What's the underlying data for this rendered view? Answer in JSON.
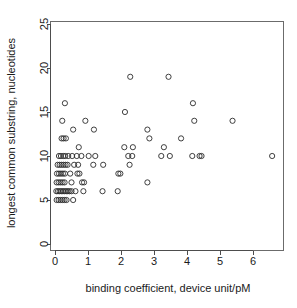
{
  "chart_data": {
    "type": "scatter",
    "title": "",
    "xlabel": "binding coefficient, device unit/pM",
    "ylabel": "longest common substring, nucleotides",
    "xlim": [
      -0.28,
      6.95
    ],
    "ylim": [
      -1.1,
      26.2
    ],
    "xticks": [
      0,
      1,
      2,
      3,
      4,
      5,
      6
    ],
    "xticklabels": [
      "0",
      "1",
      "2",
      "3",
      "4",
      "5",
      "6"
    ],
    "yticks": [
      0,
      5,
      10,
      15,
      20,
      25
    ],
    "yticklabels": [
      "0",
      "5",
      "10",
      "15",
      "20",
      "25"
    ],
    "grid": false,
    "legend": false,
    "marker": "open-circle",
    "marker_color": "#2b2b2b",
    "marker_radius_px": 2.6,
    "points": [
      [
        0.3,
        16
      ],
      [
        0.22,
        14
      ],
      [
        0.55,
        13
      ],
      [
        0.92,
        14
      ],
      [
        1.18,
        13
      ],
      [
        0.2,
        12
      ],
      [
        0.26,
        12
      ],
      [
        0.33,
        12
      ],
      [
        0.72,
        11
      ],
      [
        0.12,
        10
      ],
      [
        0.18,
        10
      ],
      [
        0.25,
        10
      ],
      [
        0.31,
        10
      ],
      [
        0.4,
        10
      ],
      [
        0.52,
        10
      ],
      [
        0.66,
        10
      ],
      [
        0.8,
        10
      ],
      [
        1.02,
        10
      ],
      [
        0.08,
        9
      ],
      [
        0.14,
        9
      ],
      [
        0.2,
        9
      ],
      [
        0.26,
        9
      ],
      [
        0.32,
        9
      ],
      [
        0.38,
        9
      ],
      [
        0.58,
        9
      ],
      [
        0.7,
        9
      ],
      [
        1.16,
        9
      ],
      [
        0.06,
        8
      ],
      [
        0.12,
        8
      ],
      [
        0.18,
        8
      ],
      [
        0.24,
        8
      ],
      [
        0.3,
        8
      ],
      [
        0.46,
        8
      ],
      [
        0.68,
        8
      ],
      [
        0.74,
        8
      ],
      [
        0.05,
        7
      ],
      [
        0.11,
        7
      ],
      [
        0.17,
        7
      ],
      [
        0.23,
        7
      ],
      [
        0.29,
        7
      ],
      [
        0.5,
        7
      ],
      [
        0.82,
        7
      ],
      [
        0.88,
        7
      ],
      [
        0.04,
        6
      ],
      [
        0.09,
        6
      ],
      [
        0.14,
        6
      ],
      [
        0.19,
        6
      ],
      [
        0.24,
        6
      ],
      [
        0.29,
        6
      ],
      [
        0.34,
        6
      ],
      [
        0.39,
        6
      ],
      [
        0.44,
        6
      ],
      [
        0.5,
        6
      ],
      [
        0.62,
        6
      ],
      [
        0.86,
        6
      ],
      [
        0.05,
        5
      ],
      [
        0.11,
        5
      ],
      [
        0.17,
        5
      ],
      [
        0.23,
        5
      ],
      [
        0.29,
        5
      ],
      [
        0.35,
        5
      ],
      [
        0.55,
        5
      ],
      [
        1.44,
        6
      ],
      [
        1.9,
        6
      ],
      [
        1.22,
        10
      ],
      [
        1.46,
        9
      ],
      [
        1.92,
        8
      ],
      [
        1.98,
        8
      ],
      [
        2.12,
        15
      ],
      [
        2.28,
        19
      ],
      [
        2.1,
        11
      ],
      [
        2.22,
        10
      ],
      [
        2.34,
        10
      ],
      [
        2.36,
        11
      ],
      [
        2.26,
        9
      ],
      [
        2.8,
        13
      ],
      [
        2.86,
        12
      ],
      [
        2.8,
        7
      ],
      [
        3.22,
        10
      ],
      [
        3.3,
        11
      ],
      [
        3.44,
        19
      ],
      [
        3.48,
        10
      ],
      [
        3.82,
        12
      ],
      [
        4.18,
        16
      ],
      [
        4.22,
        14
      ],
      [
        4.16,
        10
      ],
      [
        4.38,
        10
      ],
      [
        4.44,
        10
      ],
      [
        5.38,
        14
      ],
      [
        6.58,
        10
      ]
    ]
  }
}
